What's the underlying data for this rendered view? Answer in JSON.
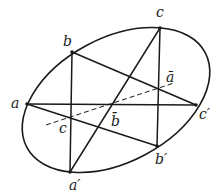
{
  "diagram": {
    "stroke_color": "#1a1a1a",
    "ellipse": {
      "cx": 116,
      "cy": 100,
      "rx": 100,
      "ry": 64,
      "rotation": -30
    },
    "points": {
      "a": {
        "x": 27,
        "y": 104,
        "label": "a"
      },
      "b": {
        "x": 72,
        "y": 52,
        "label": "b"
      },
      "c": {
        "x": 160,
        "y": 28,
        "label": "c"
      },
      "c_prime": {
        "x": 196,
        "y": 105,
        "label": "c′"
      },
      "b_prime": {
        "x": 157,
        "y": 146,
        "label": "b′"
      },
      "a_prime": {
        "x": 70,
        "y": 172,
        "label": "a′"
      }
    },
    "intersection_labels": {
      "a_bar": {
        "x": 168,
        "y": 82,
        "label": "ā"
      },
      "b_bar": {
        "x": 113,
        "y": 126,
        "label": "b̄"
      },
      "c_low": {
        "x": 61,
        "y": 132,
        "label": "c"
      }
    },
    "label_positions": {
      "a": {
        "x": 11,
        "y": 108
      },
      "b": {
        "x": 63,
        "y": 46
      },
      "c": {
        "x": 156,
        "y": 16
      },
      "c_prime": {
        "x": 200,
        "y": 118
      },
      "b_prime": {
        "x": 156,
        "y": 164
      },
      "a_prime": {
        "x": 70,
        "y": 190
      }
    },
    "pascal_line": {
      "x1": 46,
      "y1": 125,
      "x2": 174,
      "y2": 83,
      "style": "dashed"
    }
  }
}
